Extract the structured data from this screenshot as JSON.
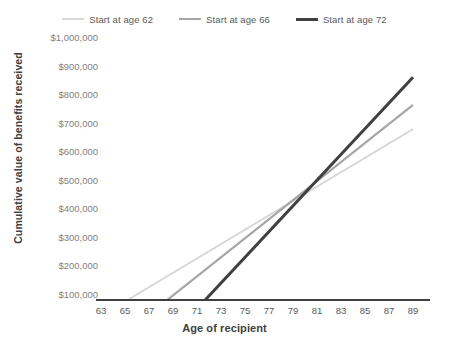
{
  "chart_data": {
    "type": "line",
    "title": "",
    "subtitle": "",
    "xlabel": "Age of recipient",
    "ylabel": "Cumulative value of benefits received",
    "xlim": [
      62,
      90
    ],
    "ylim": [
      0,
      1000000
    ],
    "grid": false,
    "legend_position": "top",
    "x_ticks": [
      63,
      65,
      67,
      69,
      71,
      73,
      75,
      77,
      79,
      81,
      83,
      85,
      87,
      89
    ],
    "x_tick_labels": [
      "63",
      "65",
      "67",
      "69",
      "71",
      "73",
      "75",
      "77",
      "79",
      "81",
      "83",
      "85",
      "87",
      "89"
    ],
    "y_ticks": [
      100000,
      200000,
      300000,
      400000,
      500000,
      600000,
      700000,
      800000,
      900000,
      1000000
    ],
    "y_tick_labels": [
      "$100,000",
      "$200,000",
      "$300,000",
      "$400,000",
      "$500,000",
      "$600,000",
      "$700,000",
      "$800,000",
      "$900,000",
      "$1,000,000"
    ],
    "series": [
      {
        "name": "Start at age 62",
        "color": "#d9d9d9",
        "width": 2,
        "x": [
          63,
          89
        ],
        "values": [
          25000,
          680000
        ]
      },
      {
        "name": "Start at age 66",
        "color": "#a6a6a6",
        "width": 2.2,
        "x": [
          67,
          89
        ],
        "values": [
          30000,
          765000
        ]
      },
      {
        "name": "Start at age 72",
        "color": "#404040",
        "width": 3,
        "x": [
          71,
          89
        ],
        "values": [
          50000,
          862000
        ]
      }
    ],
    "annotations": []
  },
  "legend": {
    "items": [
      {
        "label": "Start at age 62",
        "color": "#d9d9d9",
        "thickness": "2px"
      },
      {
        "label": "Start at age 66",
        "color": "#a6a6a6",
        "thickness": "2.5px"
      },
      {
        "label": "Start at age 72",
        "color": "#404040",
        "thickness": "3.5px"
      }
    ]
  },
  "axes": {
    "x_title": "Age of recipient",
    "y_title": "Cumulative value of benefits received",
    "axis_color": "#404040"
  }
}
